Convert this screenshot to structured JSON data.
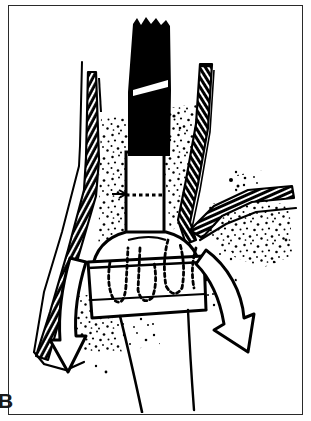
{
  "figure": {
    "panel_label": "B",
    "caption": "",
    "frame": {
      "border_color": "#2a2a2a",
      "background_color": "#ffffff",
      "x": 8,
      "y": 5,
      "width": 295,
      "height": 410
    },
    "canvas": {
      "width": 311,
      "height": 421,
      "ink_color": "#000000",
      "paper_color": "#ffffff"
    },
    "elements": [
      {
        "name": "endoscope-shaft",
        "description": "solid black instrument shaft entering from top",
        "color": "#000000",
        "top": 18,
        "bottom": 157
      },
      {
        "name": "endoscope-marker-band",
        "description": "white slanted depth-marker band on black shaft",
        "color": "#ffffff",
        "y": 86
      },
      {
        "name": "tube-white-segment",
        "description": "white tube segment below the black shaft",
        "color": "#ffffff",
        "top": 150,
        "bottom": 232
      },
      {
        "name": "tube-dashed-seam",
        "description": "dashed hidden seam across white tube segment",
        "y": 195
      },
      {
        "name": "cuff-balloon",
        "description": "inflated cuff with dashed hidden outlines",
        "top": 232,
        "bottom": 325
      },
      {
        "name": "airway-wall-left",
        "description": "hatched anatomical wall on left side"
      },
      {
        "name": "airway-wall-right",
        "description": "hatched anatomical wall on right side"
      },
      {
        "name": "branch-vessel-right",
        "description": "hatched branch extending to upper right"
      },
      {
        "name": "flow-arrow-left",
        "description": "curved open arrow sweeping down and to the left"
      },
      {
        "name": "flow-arrow-right",
        "description": "curved open arrow sweeping down and to the right"
      },
      {
        "name": "stipple-shading",
        "description": "dotted stipple shading for soft tissue"
      }
    ]
  }
}
